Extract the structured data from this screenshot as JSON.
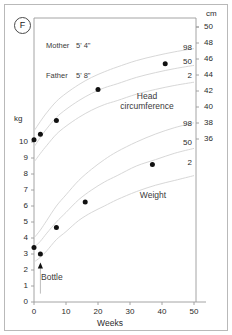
{
  "card": {
    "sex_badge": "F"
  },
  "parents": {
    "mother_label": "Mother",
    "mother_height": "5' 4\"",
    "father_label": "Father",
    "father_height": "5' 8\""
  },
  "axes": {
    "left_unit": "kg",
    "right_unit": "cm",
    "x_title": "Weeks"
  },
  "captions": {
    "head_circumference_line1": "Head",
    "head_circumference_line2": "circumference",
    "weight": "Weight",
    "bottle": "Bottle"
  },
  "chart_data": {
    "type": "line",
    "xlabel": "Weeks",
    "ylabel": "kg",
    "y2label": "cm",
    "xlim": [
      -2,
      55
    ],
    "ylim": [
      0,
      10.8
    ],
    "y2lim": [
      33.0,
      50.6
    ],
    "grid": false,
    "legend": "inline-annotations",
    "x_ticks": [
      0,
      10,
      20,
      30,
      40,
      50
    ],
    "y_ticks": [
      0,
      1,
      2,
      3,
      4,
      5,
      6,
      7,
      8,
      9,
      10
    ],
    "y2_ticks": [
      36,
      38,
      40,
      42,
      44,
      46,
      48,
      50
    ],
    "series": [
      {
        "name": "Weight",
        "axis": "left",
        "unit": "kg",
        "marker": "filled-circle",
        "points": [
          {
            "x": 0,
            "y": 3.4
          },
          {
            "x": 2,
            "y": 3.0
          },
          {
            "x": 7,
            "y": 4.65
          },
          {
            "x": 16,
            "y": 6.25
          },
          {
            "x": 37,
            "y": 8.6
          }
        ]
      },
      {
        "name": "Head circumference",
        "axis": "right",
        "unit": "cm",
        "marker": "filled-circle",
        "points": [
          {
            "x": 0,
            "y": 35.9
          },
          {
            "x": 2,
            "y": 36.6
          },
          {
            "x": 7,
            "y": 38.3
          },
          {
            "x": 20,
            "y": 42.2
          },
          {
            "x": 41,
            "y": 45.4
          }
        ]
      }
    ],
    "reference_curves": [
      {
        "name": "Weight 98th centile",
        "centile": 98,
        "axis": "left",
        "x": [
          0,
          2,
          4,
          7,
          10,
          14,
          18,
          22,
          26,
          32,
          38,
          44,
          50
        ],
        "y": [
          4.0,
          4.5,
          5.1,
          6.0,
          6.7,
          7.6,
          8.3,
          8.9,
          9.4,
          10.0,
          10.5,
          10.9,
          11.2
        ]
      },
      {
        "name": "Weight 50th centile",
        "centile": 50,
        "axis": "left",
        "x": [
          0,
          2,
          4,
          7,
          10,
          14,
          18,
          22,
          26,
          32,
          38,
          44,
          50
        ],
        "y": [
          3.4,
          3.8,
          4.3,
          5.0,
          5.6,
          6.4,
          7.0,
          7.5,
          7.9,
          8.5,
          8.9,
          9.3,
          9.6
        ]
      },
      {
        "name": "Weight 2nd centile",
        "centile": 2,
        "axis": "left",
        "x": [
          0,
          2,
          4,
          7,
          10,
          14,
          18,
          22,
          26,
          32,
          38,
          44,
          50
        ],
        "y": [
          2.5,
          2.8,
          3.2,
          3.9,
          4.4,
          5.1,
          5.6,
          6.0,
          6.4,
          6.9,
          7.3,
          7.6,
          7.9
        ]
      },
      {
        "name": "Head circumference 98th centile",
        "centile": 98,
        "axis": "right",
        "x": [
          0,
          2,
          4,
          7,
          10,
          14,
          18,
          22,
          26,
          32,
          38,
          44,
          50
        ],
        "y": [
          37.0,
          38.2,
          39.3,
          40.7,
          41.7,
          42.8,
          43.7,
          44.4,
          45.0,
          45.8,
          46.4,
          46.9,
          47.3
        ]
      },
      {
        "name": "Head circumference 50th centile",
        "centile": 50,
        "axis": "right",
        "x": [
          0,
          2,
          4,
          7,
          10,
          14,
          18,
          22,
          26,
          32,
          38,
          44,
          50
        ],
        "y": [
          35.0,
          36.2,
          37.3,
          38.7,
          39.7,
          40.8,
          41.7,
          42.4,
          42.9,
          43.7,
          44.3,
          44.8,
          45.2
        ]
      },
      {
        "name": "Head circumference 2nd centile",
        "centile": 2,
        "axis": "right",
        "x": [
          0,
          2,
          4,
          7,
          10,
          14,
          18,
          22,
          26,
          32,
          38,
          44,
          50
        ],
        "y": [
          33.1,
          34.2,
          35.2,
          36.6,
          37.6,
          38.7,
          39.6,
          40.3,
          40.8,
          41.6,
          42.2,
          42.7,
          43.1
        ]
      }
    ],
    "annotations": [
      {
        "label": "Bottle",
        "type": "up-arrow",
        "x": 2,
        "y": 2.4,
        "axis": "left"
      }
    ],
    "centile_labels_right": {
      "head_circumference": [
        98,
        50,
        2
      ],
      "weight": [
        98,
        50,
        2
      ]
    }
  }
}
